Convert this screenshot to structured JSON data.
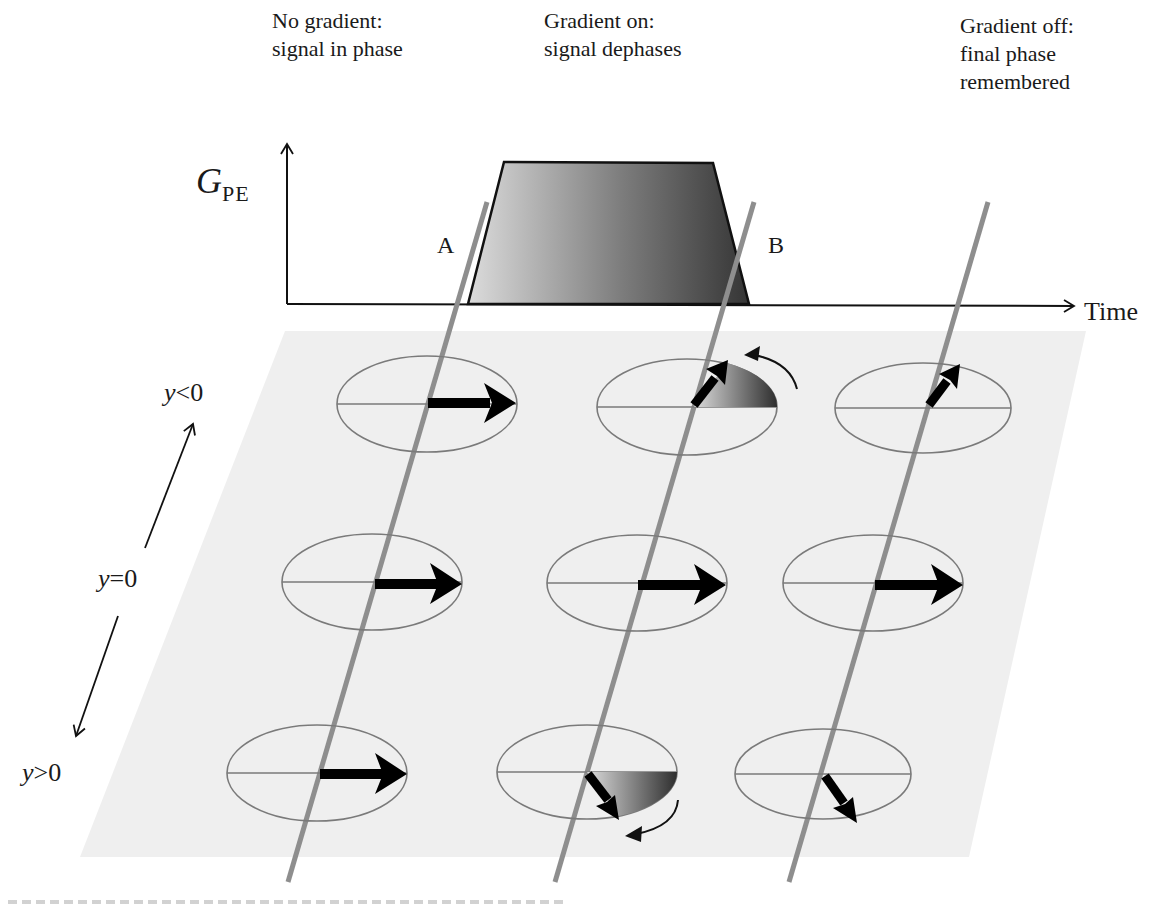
{
  "header_labels": {
    "no_gradient": [
      "No gradient:",
      "signal in phase"
    ],
    "gradient_on": [
      "Gradient on:",
      "signal dephases"
    ],
    "gradient_off": [
      "Gradient off:",
      "final phase",
      "remembered"
    ]
  },
  "gradient_plot": {
    "y_axis_label_main": "G",
    "y_axis_label_sub": "PE",
    "x_axis_label": "Time",
    "point_a": "A",
    "point_b": "B",
    "pulse_shape": "trapezoid"
  },
  "position_axis": {
    "y_less": "y<0",
    "y_zero": "y=0",
    "y_greater": "y>0",
    "y_less_parts": [
      "y",
      "<0"
    ],
    "y_zero_parts": [
      "y",
      "=0"
    ],
    "y_greater_parts": [
      "y",
      ">0"
    ]
  },
  "spin_grid": {
    "rows": [
      "y<0",
      "y=0",
      "y>0"
    ],
    "columns": [
      "before gradient",
      "during gradient",
      "after gradient"
    ],
    "phase_angles_deg": [
      [
        0,
        55,
        55
      ],
      [
        0,
        0,
        0
      ],
      [
        0,
        -55,
        -55
      ]
    ]
  },
  "colors": {
    "plane": "#eeeeee",
    "time_line": "#8c8c8c",
    "ellipse_stroke": "#7a7a7a",
    "arrow": "#000000",
    "pulse_light": "#d8d8d8",
    "pulse_dark": "#3a3a3a"
  },
  "caption": ""
}
